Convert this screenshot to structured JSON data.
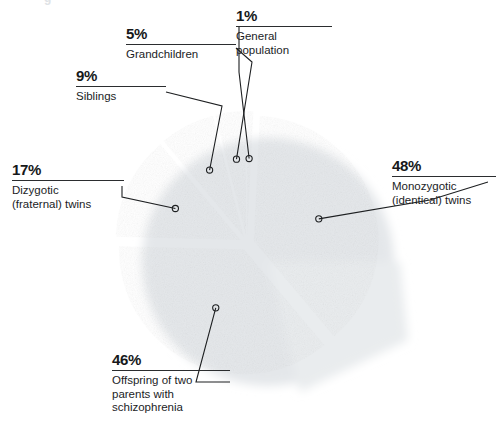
{
  "chart_data": {
    "type": "pie",
    "title": "",
    "subtitle": "",
    "xlabel": "",
    "ylabel": "",
    "legend_position": "callout-labels",
    "grid": false,
    "units": "percent",
    "exploded": true,
    "start_angle_deg": 0,
    "direction": "clockwise",
    "categories": [
      "General population",
      "Monozygotic (identical) twins",
      "Offspring of two parents with schizophrenia",
      "Dizygotic (fraternal) twins",
      "Siblings",
      "Grandchildren"
    ],
    "values": [
      1,
      48,
      46,
      17,
      9,
      5
    ],
    "slices": [
      {
        "key": "general-population",
        "percent_label": "1%",
        "value": 1,
        "name": "General population",
        "name_lines": "General\npopulation",
        "color": "#a8394f"
      },
      {
        "key": "monozygotic-twins",
        "percent_label": "48%",
        "value": 48,
        "name": "Monozygotic (identical) twins",
        "name_lines": "Monozygotic\n(identical) twins",
        "color": "#3b7ba5"
      },
      {
        "key": "offspring-two-parents",
        "percent_label": "46%",
        "value": 46,
        "name": "Offspring of two parents with schizophrenia",
        "name_lines": "Offspring of two\nparents with\nschizophrenia",
        "color": "#63807b"
      },
      {
        "key": "dizygotic-twins",
        "percent_label": "17%",
        "value": 17,
        "name": "Dizygotic (fraternal) twins",
        "name_lines": "Dizygotic\n(fraternal) twins",
        "color": "#7c3f78"
      },
      {
        "key": "siblings",
        "percent_label": "9%",
        "value": 9,
        "name": "Siblings",
        "name_lines": "Siblings",
        "color": "#9c8238"
      },
      {
        "key": "grandchildren",
        "percent_label": "5%",
        "value": 5,
        "name": "Grandchildren",
        "name_lines": "Grandchildren",
        "color": "#8d6b23"
      }
    ]
  },
  "colors": {
    "background": "#ffffff",
    "shadow": "#e4e7ea",
    "leader_line": "#1d1f21",
    "text": "#16181a",
    "rule": "#2b2d2f"
  },
  "artifacts": {
    "top_bleed_glyph": "g"
  }
}
